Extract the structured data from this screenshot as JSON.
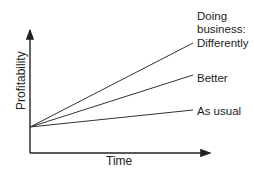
{
  "diagram": {
    "x_axis_label": "Time",
    "y_axis_label": "Profitability",
    "legend_title_line1": "Doing",
    "legend_title_line2": "business:",
    "lines": [
      {
        "label": "Differently"
      },
      {
        "label": "Better"
      },
      {
        "label": "As usual"
      }
    ],
    "line_color": "#333333"
  }
}
